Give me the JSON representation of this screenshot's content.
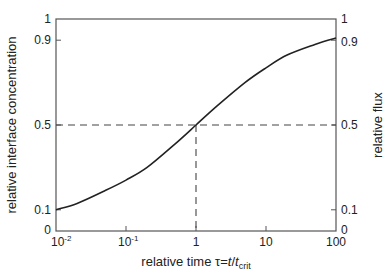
{
  "chart_data": {
    "type": "line",
    "title": "",
    "xlabel": "relative time τ=t/t_crit",
    "xlabel_parts": {
      "prefix": "relative time τ=",
      "t": "t",
      "slash": "/",
      "t2": "t",
      "sub": "crit"
    },
    "ylabel": "relative interface concentration",
    "ylabel_right": "relative flux",
    "xscale": "log",
    "xlim": [
      0.01,
      100
    ],
    "ylim": [
      0,
      1
    ],
    "grid": false,
    "legend": null,
    "x_ticks": [
      {
        "value": 0.01,
        "base": "10",
        "exp": "-2"
      },
      {
        "value": 0.1,
        "base": "10",
        "exp": "-1"
      },
      {
        "value": 1,
        "label": "1"
      },
      {
        "value": 10,
        "label": "10"
      },
      {
        "value": 100,
        "label": "100"
      }
    ],
    "y_ticks_left": [
      "0",
      "0.1",
      "0.5",
      "0.9",
      "1"
    ],
    "y_ticks_right": [
      "0",
      "0.1",
      "0.5",
      "0.9",
      "1"
    ],
    "series": [
      {
        "name": "relative interface concentration / relative flux",
        "x": [
          0.01,
          0.02,
          0.05,
          0.1,
          0.2,
          0.5,
          1,
          2,
          5,
          10,
          20,
          50,
          100
        ],
        "y": [
          0.1,
          0.13,
          0.19,
          0.24,
          0.3,
          0.41,
          0.5,
          0.59,
          0.7,
          0.77,
          0.83,
          0.88,
          0.91
        ]
      }
    ],
    "annotations": [
      {
        "type": "dashed-hline",
        "y": 0.5,
        "x_from": 0.01,
        "x_to": 100
      },
      {
        "type": "dashed-vline",
        "x": 1,
        "y_from": 0,
        "y_to": 0.5
      }
    ]
  },
  "labels": {
    "xlabel_prefix": "relative time τ=",
    "xlabel_t": "t",
    "xlabel_slash": "/",
    "xlabel_t2": "t",
    "xlabel_sub": "crit",
    "ylabel_left": "relative interface concentration",
    "ylabel_right": "relative flux",
    "yl_0": "0",
    "yl_01": "0.1",
    "yl_05": "0.5",
    "yl_09": "0.9",
    "yl_1": "1",
    "yr_0": "0",
    "yr_01": "0.1",
    "yr_05": "0.5",
    "yr_09": "0.9",
    "yr_1": "1",
    "x_1e2_base": "10",
    "x_1e2_exp": "-2",
    "x_1e1_base": "10",
    "x_1e1_exp": "-1",
    "x_1": "1",
    "x_10": "10",
    "x_100": "100"
  },
  "colors": {
    "axis": "#555555",
    "curve": "#222222",
    "dash": "#444444",
    "text": "#222222"
  }
}
